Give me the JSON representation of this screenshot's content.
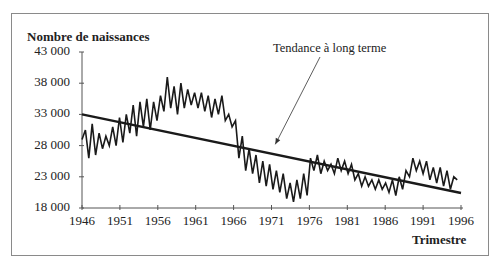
{
  "chart_data": {
    "type": "line",
    "title": "",
    "ylabel": "Nombre de naissances",
    "xlabel": "Trimestre",
    "ylim": [
      18000,
      43000
    ],
    "xlim": [
      1946,
      1996
    ],
    "y_ticks": [
      "43 000",
      "38 000",
      "33 000",
      "28 000",
      "23 000",
      "18 000"
    ],
    "y_tick_values": [
      43000,
      38000,
      33000,
      28000,
      23000,
      18000
    ],
    "x_ticks": [
      "1946",
      "1951",
      "1956",
      "1961",
      "1966",
      "1971",
      "1976",
      "1981",
      "1986",
      "1991",
      "1996"
    ],
    "x_tick_values": [
      1946,
      1951,
      1956,
      1961,
      1966,
      1971,
      1976,
      1981,
      1986,
      1991,
      1996
    ],
    "grid": false,
    "legend": null,
    "annotations": [
      {
        "text": "Tendance à long terme",
        "arrow_to": {
          "x": 1971.5,
          "y": 28200
        }
      }
    ],
    "series": [
      {
        "name": "Naissances trimestrielles",
        "x_start": 1946,
        "x_step": 0.5,
        "values": [
          29000,
          30500,
          26000,
          31500,
          26500,
          30000,
          27500,
          29500,
          28000,
          31000,
          28000,
          32500,
          28500,
          33000,
          30000,
          34500,
          29500,
          35000,
          31000,
          35500,
          30500,
          35000,
          32000,
          36000,
          33500,
          39000,
          34000,
          37500,
          33000,
          38000,
          34000,
          37000,
          34500,
          36500,
          34000,
          36500,
          33500,
          36000,
          32500,
          35500,
          33000,
          36000,
          32000,
          33000,
          31000,
          32000,
          26000,
          29500,
          24000,
          27500,
          23500,
          26500,
          22000,
          25500,
          21500,
          25000,
          21000,
          24000,
          20500,
          23500,
          19500,
          22000,
          19000,
          22500,
          19500,
          23500,
          20000,
          26000,
          24000,
          26500,
          23500,
          25500,
          24000,
          25000,
          23500,
          26000,
          24000,
          25500,
          23500,
          25000,
          22500,
          23500,
          21500,
          23000,
          21500,
          22500,
          21000,
          22500,
          21000,
          22000,
          20500,
          22500,
          20000,
          23000,
          21000,
          24000,
          23000,
          26000,
          24000,
          25500,
          23500,
          25500,
          22500,
          24500,
          22000,
          24500,
          21500,
          24000,
          21000,
          23000,
          22500
        ]
      },
      {
        "name": "Tendance à long terme",
        "x": [
          1946,
          1996
        ],
        "values": [
          33000,
          20400
        ]
      }
    ]
  },
  "axes": {
    "y_title": "Nombre de naissances",
    "x_title": "Trimestre"
  },
  "annotation_text": "Tendance à long terme"
}
